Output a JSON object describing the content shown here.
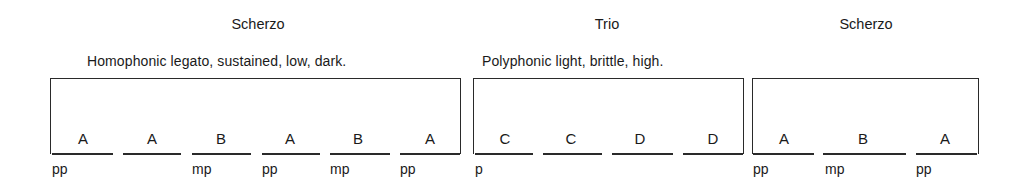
{
  "sections": [
    {
      "title": "Scherzo",
      "description": "Homophonic  legato, sustained, low, dark.",
      "parts": [
        {
          "letter": "A",
          "dynamic": "pp"
        },
        {
          "letter": "A",
          "dynamic": ""
        },
        {
          "letter": "B",
          "dynamic": "mp"
        },
        {
          "letter": "A",
          "dynamic": "pp"
        },
        {
          "letter": "B",
          "dynamic": "mp"
        },
        {
          "letter": "A",
          "dynamic": "pp"
        }
      ]
    },
    {
      "title": "Trio",
      "description": "Polyphonic  light, brittle, high.",
      "parts": [
        {
          "letter": "C",
          "dynamic": "p"
        },
        {
          "letter": "C",
          "dynamic": ""
        },
        {
          "letter": "D",
          "dynamic": ""
        },
        {
          "letter": "D",
          "dynamic": ""
        }
      ]
    },
    {
      "title": "Scherzo",
      "description": "",
      "parts": [
        {
          "letter": "A",
          "dynamic": "pp"
        },
        {
          "letter": "B",
          "dynamic": "mp"
        },
        {
          "letter": "A",
          "dynamic": "pp"
        }
      ]
    }
  ]
}
